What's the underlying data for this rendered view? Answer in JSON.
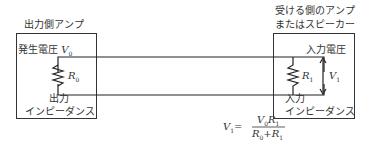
{
  "left_block": {
    "title": "出力側アンプ",
    "source_label": "発生電圧",
    "source_symbol": "V",
    "source_sub": "0",
    "resistor_symbol": "R",
    "resistor_sub": "0",
    "impedance_line1": "出力",
    "impedance_line2": "インピーダンス"
  },
  "right_block": {
    "title_line1": "受ける側のアンプ",
    "title_line2": "またはスピーカー",
    "voltage_label": "入力電圧",
    "voltage_symbol": "V",
    "voltage_sub": "1",
    "resistor_symbol": "R",
    "resistor_sub": "1",
    "impedance_line1": "入力",
    "impedance_line2": "インピーダンス"
  },
  "formula": {
    "lhs": "V",
    "lhs_sub": "1",
    "eq": "=",
    "num_a": "V",
    "num_a_sub": "0",
    "num_b": "R",
    "num_b_sub": "1",
    "den_a": "R",
    "den_a_sub": "0",
    "plus": "+",
    "den_b": "R",
    "den_b_sub": "1"
  }
}
